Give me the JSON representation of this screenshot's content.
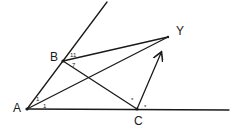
{
  "diagram": {
    "points": {
      "A": {
        "label": "A",
        "x": 27,
        "y": 109
      },
      "B": {
        "label": "B",
        "x": 63,
        "y": 61
      },
      "C": {
        "label": "C",
        "x": 137,
        "y": 109
      },
      "Y": {
        "label": "Y",
        "x": 168,
        "y": 37
      }
    },
    "angle_marks": {
      "A_upper": "1",
      "A_lower": "1",
      "B_upper": "11",
      "B_lower": "7",
      "C_left": "*",
      "C_right": "*"
    }
  }
}
